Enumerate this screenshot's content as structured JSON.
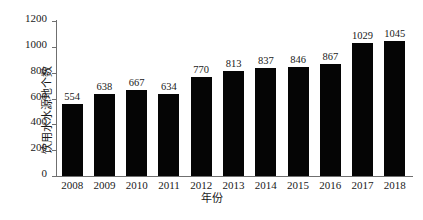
{
  "chart_data": {
    "type": "bar",
    "title": "",
    "subtitle": "",
    "xlabel": "年份",
    "ylabel": "饮用水水源地个数",
    "categories": [
      "2008",
      "2009",
      "2010",
      "2011",
      "2012",
      "2013",
      "2014",
      "2015",
      "2016",
      "2017",
      "2018"
    ],
    "values": [
      554,
      638,
      667,
      634,
      770,
      813,
      837,
      846,
      867,
      1029,
      1045
    ],
    "series": [
      {
        "name": "饮用水水源地个数",
        "values": [
          554,
          638,
          667,
          634,
          770,
          813,
          837,
          846,
          867,
          1029,
          1045
        ]
      }
    ],
    "data_labels": [
      "554",
      "638",
      "667",
      "634",
      "770",
      "813",
      "837",
      "846",
      "867",
      "1029",
      "1045"
    ],
    "ylim": [
      0,
      1200
    ],
    "yticks": [
      0,
      200,
      400,
      600,
      800,
      1000,
      1200
    ],
    "ytick_labels": [
      "0",
      "200",
      "400",
      "600",
      "800",
      "1000",
      "1200"
    ],
    "xtick_labels": [
      "2008",
      "2009",
      "2010",
      "2011",
      "2012",
      "2013",
      "2014",
      "2015",
      "2016",
      "2017",
      "2018"
    ],
    "grid": false,
    "legend": false,
    "legend_position": "none",
    "bar_color": "#050505",
    "axis_color": "#6f6f6f",
    "text_color": "#1a1a1a",
    "background_color": "#ffffff"
  }
}
